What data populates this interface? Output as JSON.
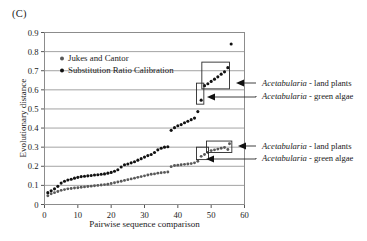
{
  "panel": {
    "label": "(C)"
  },
  "axes": {
    "ylabel": "Evolutionary distance",
    "xlabel": "Pairwise sequence comparison",
    "yticks": [
      "0",
      "0.1",
      "0.2",
      "0.3",
      "0.4",
      "0.5",
      "0.6",
      "0.7",
      "0.8",
      "0.9"
    ],
    "xticks": [
      "0",
      "10",
      "20",
      "30",
      "40",
      "50",
      "60"
    ]
  },
  "legend": {
    "items": [
      {
        "label": "Jukes and Cantor",
        "color": "#595959",
        "marker": "circle"
      },
      {
        "label": "Substitution Ratio Calibration",
        "color": "#111111",
        "marker": "circle"
      }
    ]
  },
  "annotations": [
    {
      "id": "upper-land-plants",
      "text_italic": "Acetabularia",
      "text_rest": " - land plants"
    },
    {
      "id": "upper-green-algae",
      "text_italic": "Acetabularia",
      "text_rest": " - green algae"
    },
    {
      "id": "lower-land-plants",
      "text_italic": "Acetabularia",
      "text_rest": " - land plants"
    },
    {
      "id": "lower-green-algae",
      "text_italic": "Acetabularia",
      "text_rest": " - green algae"
    }
  ],
  "chart_data": {
    "type": "scatter",
    "title": "(C)",
    "xlabel": "Pairwise sequence comparison",
    "ylabel": "Evolutionary distance",
    "xlim": [
      0,
      60
    ],
    "ylim": [
      0,
      0.9
    ],
    "xticks": [
      0,
      10,
      20,
      30,
      40,
      50,
      60
    ],
    "yticks": [
      0,
      0.1,
      0.2,
      0.3,
      0.4,
      0.5,
      0.6,
      0.7,
      0.8,
      0.9
    ],
    "grid": "horizontal",
    "legend_position": "upper-left-inside",
    "series": [
      {
        "name": "Substitution Ratio Calibration",
        "color": "#111111",
        "marker": "circle",
        "points": [
          [
            1,
            0.062
          ],
          [
            2,
            0.072
          ],
          [
            3,
            0.082
          ],
          [
            4,
            0.095
          ],
          [
            5,
            0.112
          ],
          [
            6,
            0.122
          ],
          [
            7,
            0.128
          ],
          [
            8,
            0.132
          ],
          [
            9,
            0.138
          ],
          [
            10,
            0.142
          ],
          [
            11,
            0.146
          ],
          [
            12,
            0.148
          ],
          [
            13,
            0.15
          ],
          [
            14,
            0.152
          ],
          [
            15,
            0.154
          ],
          [
            16,
            0.156
          ],
          [
            17,
            0.158
          ],
          [
            18,
            0.16
          ],
          [
            19,
            0.164
          ],
          [
            20,
            0.168
          ],
          [
            21,
            0.174
          ],
          [
            22,
            0.182
          ],
          [
            23,
            0.196
          ],
          [
            24,
            0.208
          ],
          [
            25,
            0.212
          ],
          [
            26,
            0.218
          ],
          [
            27,
            0.224
          ],
          [
            28,
            0.232
          ],
          [
            29,
            0.24
          ],
          [
            30,
            0.248
          ],
          [
            31,
            0.256
          ],
          [
            32,
            0.262
          ],
          [
            33,
            0.272
          ],
          [
            34,
            0.286
          ],
          [
            35,
            0.294
          ],
          [
            36,
            0.3
          ],
          [
            37,
            0.302
          ],
          [
            38,
            0.388
          ],
          [
            39,
            0.402
          ],
          [
            40,
            0.412
          ],
          [
            41,
            0.418
          ],
          [
            42,
            0.428
          ],
          [
            43,
            0.436
          ],
          [
            44,
            0.444
          ],
          [
            45,
            0.452
          ],
          [
            46,
            0.486
          ],
          [
            47,
            0.546
          ],
          [
            48,
            0.622
          ],
          [
            49,
            0.632
          ],
          [
            50,
            0.644
          ],
          [
            51,
            0.656
          ],
          [
            52,
            0.668
          ],
          [
            53,
            0.682
          ],
          [
            54,
            0.694
          ],
          [
            55,
            0.716
          ],
          [
            56,
            0.84
          ]
        ]
      },
      {
        "name": "Jukes and Cantor",
        "color": "#595959",
        "marker": "circle",
        "points": [
          [
            1,
            0.046
          ],
          [
            2,
            0.056
          ],
          [
            3,
            0.062
          ],
          [
            4,
            0.068
          ],
          [
            5,
            0.074
          ],
          [
            6,
            0.078
          ],
          [
            7,
            0.082
          ],
          [
            8,
            0.084
          ],
          [
            9,
            0.086
          ],
          [
            10,
            0.088
          ],
          [
            11,
            0.09
          ],
          [
            12,
            0.092
          ],
          [
            13,
            0.094
          ],
          [
            14,
            0.096
          ],
          [
            15,
            0.098
          ],
          [
            16,
            0.1
          ],
          [
            17,
            0.102
          ],
          [
            18,
            0.104
          ],
          [
            19,
            0.106
          ],
          [
            20,
            0.11
          ],
          [
            21,
            0.114
          ],
          [
            22,
            0.118
          ],
          [
            23,
            0.122
          ],
          [
            24,
            0.126
          ],
          [
            25,
            0.13
          ],
          [
            26,
            0.134
          ],
          [
            27,
            0.138
          ],
          [
            28,
            0.142
          ],
          [
            29,
            0.146
          ],
          [
            30,
            0.15
          ],
          [
            31,
            0.154
          ],
          [
            32,
            0.158
          ],
          [
            33,
            0.16
          ],
          [
            34,
            0.164
          ],
          [
            35,
            0.166
          ],
          [
            36,
            0.168
          ],
          [
            37,
            0.17
          ],
          [
            38,
            0.198
          ],
          [
            39,
            0.204
          ],
          [
            40,
            0.206
          ],
          [
            41,
            0.208
          ],
          [
            42,
            0.21
          ],
          [
            43,
            0.212
          ],
          [
            44,
            0.214
          ],
          [
            45,
            0.218
          ],
          [
            46,
            0.226
          ],
          [
            47,
            0.252
          ],
          [
            48,
            0.262
          ],
          [
            49,
            0.272
          ],
          [
            50,
            0.282
          ],
          [
            51,
            0.286
          ],
          [
            52,
            0.29
          ],
          [
            53,
            0.294
          ],
          [
            54,
            0.298
          ],
          [
            55,
            0.288
          ],
          [
            55.5,
            0.318
          ]
        ]
      }
    ],
    "highlight_boxes": [
      {
        "id": "upper-land-plants-box",
        "x0": 47.2,
        "x1": 55.5,
        "y0": 0.605,
        "y1": 0.745
      },
      {
        "id": "upper-green-algae-box",
        "x0": 45.6,
        "x1": 47.8,
        "y0": 0.525,
        "y1": 0.635
      },
      {
        "id": "lower-land-plants-box",
        "x0": 48.6,
        "x1": 56.2,
        "y0": 0.272,
        "y1": 0.332
      },
      {
        "id": "lower-green-algae-box",
        "x0": 45.6,
        "x1": 49.2,
        "y0": 0.235,
        "y1": 0.3
      }
    ]
  }
}
